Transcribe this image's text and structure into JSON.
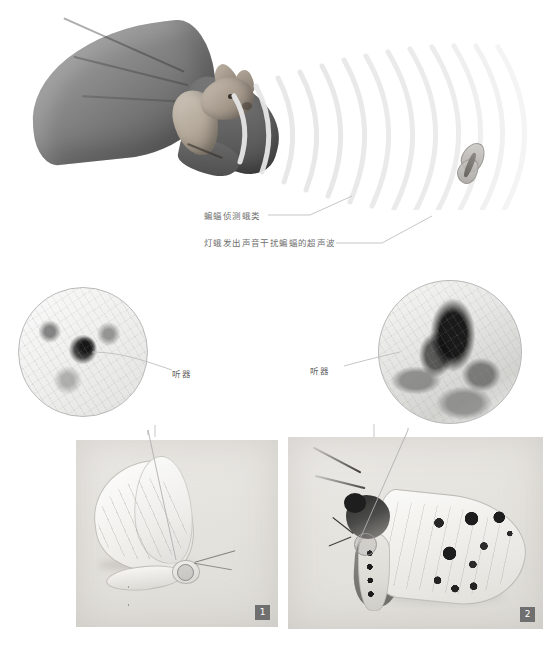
{
  "figure": {
    "background_color": "#ffffff",
    "width": 554,
    "height": 645
  },
  "top_panel": {
    "name": "bat-echolocation-illustration",
    "bat": {
      "label": "蝙蝠",
      "description": "flying bat illustration, grayscale"
    },
    "sonar": {
      "label": "超声波",
      "arc_count": 13,
      "color": "#e9e9e9"
    },
    "target_moth": {
      "label": "蛾",
      "description": "small pale moth at right"
    },
    "annotations": [
      {
        "id": "bat-detect",
        "text": "蝙蝠侦测蛾类",
        "color": "#6f6f6f",
        "leader": true
      },
      {
        "id": "moth-jam",
        "text": "灯蛾发出声音干扰蝙蝠的超声波",
        "color": "#6f6f6f",
        "leader": true
      }
    ]
  },
  "mid_panel": {
    "name": "tympanal-organ-insets",
    "insets": [
      {
        "id": "inset-left",
        "caption": "听器",
        "diameter": 128,
        "border_color": "#b9b9b9",
        "description": "microscopic close-up of tympanal organ, specimen 1"
      },
      {
        "id": "inset-right",
        "caption": "听器",
        "diameter": 142,
        "border_color": "#b9b9b9",
        "description": "microscopic close-up of tympanal organ, specimen 2"
      }
    ],
    "label_color": "#5f5f5f"
  },
  "bottom_panel": {
    "name": "moth-specimen-plates",
    "plates": [
      {
        "id": "plate-left",
        "badge": "1",
        "badge_color": "#6f6f6f",
        "badge_text_color": "#ffffff",
        "description": "pale white moth specimen, side view, tympanal organ circled"
      },
      {
        "id": "plate-right",
        "badge": "2",
        "badge_color": "#6f6f6f",
        "badge_text_color": "#ffffff",
        "description": "spotted tiger moth specimen, side view, tympanal organ circled"
      }
    ]
  },
  "corner_mark": {
    "text": ""
  },
  "palette": {
    "page_background": "#ffffff",
    "annotation_text": "#6f6f6f",
    "organ_label_text": "#5f5f5f",
    "leader_line": "#b4b4b4",
    "inset_border": "#b9b9b9",
    "badge_fill": "#6f6f6f",
    "plate_fill": "#e9e7e3",
    "sonar_arc": "#ebebeb"
  }
}
